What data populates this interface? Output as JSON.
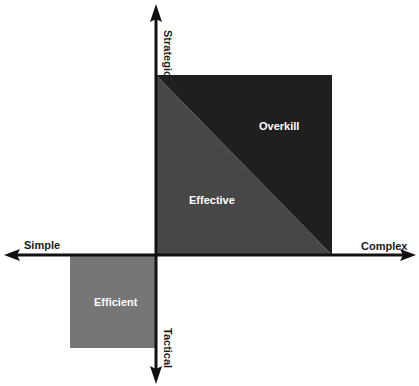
{
  "diagram": {
    "axes": {
      "top": "Strategic",
      "bottom": "Tactical",
      "left": "Simple",
      "right": "Complex"
    },
    "regions": [
      {
        "name": "Overkill",
        "color": "#1f1f1f",
        "position": "upper-right triangle (above diagonal)"
      },
      {
        "name": "Effective",
        "color": "#474747",
        "position": "upper-right triangle (below diagonal)"
      },
      {
        "name": "Efficient",
        "color": "#767676",
        "position": "lower-left quadrant square"
      }
    ],
    "colors": {
      "axis": "#111111",
      "overkill": "#1f1f1f",
      "effective": "#474747",
      "efficient": "#767676",
      "background": "#ffffff"
    }
  }
}
